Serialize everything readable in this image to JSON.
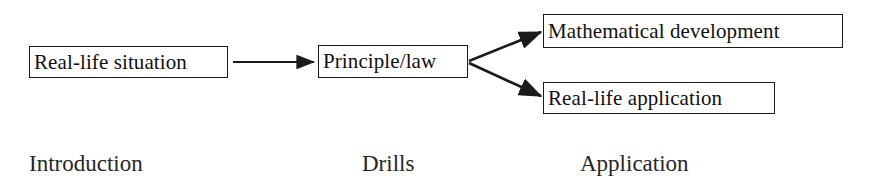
{
  "diagram": {
    "background_color": "#ffffff",
    "line_color": "#1b1b1b",
    "text_color": "#111111",
    "nodes": [
      {
        "id": "situation",
        "label": "Real-life situation"
      },
      {
        "id": "principle",
        "label": "Principle/law"
      },
      {
        "id": "math",
        "label": "Mathematical development"
      },
      {
        "id": "application",
        "label": "Real-life application"
      }
    ],
    "edges": [
      {
        "id": "situation-to-principle",
        "from": "Real-life situation",
        "to": "Principle/law",
        "style": "solid-arrow"
      },
      {
        "id": "principle-to-math",
        "from": "Principle/law",
        "to": "Mathematical development",
        "style": "solid-arrow"
      },
      {
        "id": "principle-to-application",
        "from": "Principle/law",
        "to": "Real-life application",
        "style": "solid-arrow"
      }
    ],
    "captions": [
      {
        "id": "introduction",
        "label": "Introduction"
      },
      {
        "id": "drills",
        "label": "Drills"
      },
      {
        "id": "application",
        "label": "Application"
      }
    ]
  }
}
